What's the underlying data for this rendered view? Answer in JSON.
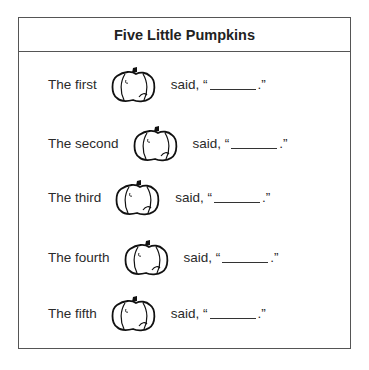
{
  "title": "Five Little Pumpkins",
  "rows": [
    {
      "prefix": "The first",
      "suffix_start": "said, “",
      "suffix_end": " .”",
      "icon": "pumpkin-icon"
    },
    {
      "prefix": "The second",
      "suffix_start": "said, “",
      "suffix_end": " .”",
      "icon": "pumpkin-icon"
    },
    {
      "prefix": "The third",
      "suffix_start": "said, “",
      "suffix_end": " .”",
      "icon": "pumpkin-icon"
    },
    {
      "prefix": "The fourth",
      "suffix_start": "said, “",
      "suffix_end": " .”",
      "icon": "pumpkin-icon"
    },
    {
      "prefix": "The fifth",
      "suffix_start": "said, “",
      "suffix_end": " .”",
      "icon": "pumpkin-icon"
    }
  ]
}
